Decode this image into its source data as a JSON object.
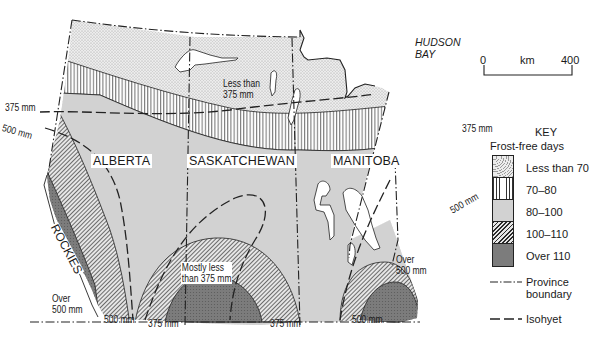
{
  "map": {
    "title_region": "Prairie Provinces — Frost-free days and precipitation",
    "provinces": [
      {
        "name": "ALBERTA"
      },
      {
        "name": "SASKATCHEWAN"
      },
      {
        "name": "MANITOBA"
      }
    ],
    "features": {
      "hudson_bay": [
        "HUDSON",
        "BAY"
      ],
      "rockies": "ROCKIES"
    },
    "scale_bar": {
      "start": "0",
      "unit": "km",
      "end": "400"
    },
    "isohyet_labels": [
      {
        "id": "iso-375-west",
        "text": "375 mm"
      },
      {
        "id": "iso-500-west",
        "text": "500 mm"
      },
      {
        "id": "iso-375-east",
        "text": "375 mm"
      },
      {
        "id": "iso-500-east",
        "text": "500 mm"
      },
      {
        "id": "iso-500-bottom-1",
        "text": "500 mm"
      },
      {
        "id": "iso-375-bottom-1",
        "text": "375 mm"
      },
      {
        "id": "iso-375-bottom-2",
        "text": "375 mm"
      },
      {
        "id": "iso-500-bottom-2",
        "text": "500 mm"
      }
    ],
    "area_notes": [
      {
        "id": "note-less-than-375",
        "lines": [
          "Less than",
          "375 mm"
        ]
      },
      {
        "id": "note-mostly-less",
        "lines": [
          "Mostly less",
          "than 375 mm"
        ]
      },
      {
        "id": "note-over-500-sw",
        "lines": [
          "Over",
          "500 mm"
        ]
      },
      {
        "id": "note-over-500-east",
        "lines": [
          "Over",
          "500 mm"
        ]
      }
    ]
  },
  "legend": {
    "key_label": "KEY",
    "title": "Frost-free days",
    "items": [
      {
        "label": "Less than 70",
        "pattern": "stipple-light",
        "color": "#e4e4e4"
      },
      {
        "label": "70–80",
        "pattern": "vertical-lines",
        "color": "#ffffff"
      },
      {
        "label": "80–100",
        "pattern": "solid-grey",
        "color": "#cfcfcf"
      },
      {
        "label": "100–110",
        "pattern": "diagonal-hatch",
        "color": "#9a9a9a"
      },
      {
        "label": "Over 110",
        "pattern": "dark-stipple",
        "color": "#7a7a7a"
      }
    ],
    "lines": [
      {
        "label_lines": [
          "Province",
          "boundary"
        ],
        "style": "dash-dot"
      },
      {
        "label_lines": [
          "Isohyet"
        ],
        "style": "long-dash"
      }
    ]
  }
}
